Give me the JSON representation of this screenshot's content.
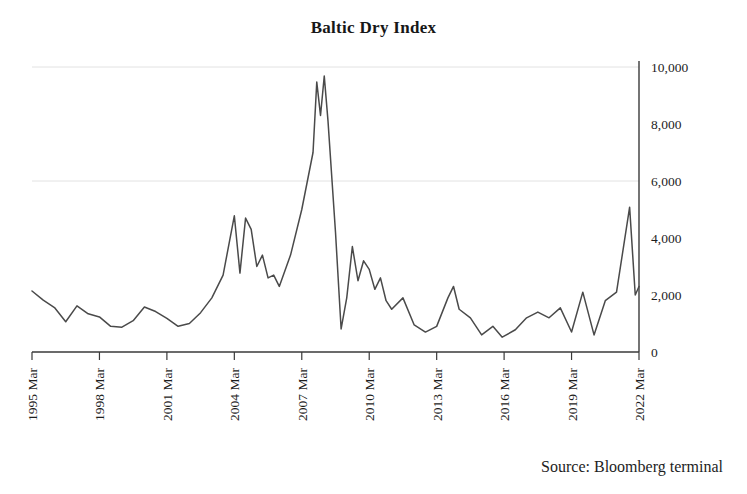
{
  "figure": {
    "title": "Baltic Dry Index",
    "source_note": "Source: Bloomberg terminal"
  },
  "chart_data": {
    "type": "line",
    "title": "Baltic Dry Index",
    "xlabel": "",
    "ylabel": "",
    "ylim": [
      0,
      10000
    ],
    "yticks": [
      0,
      2000,
      4000,
      6000,
      8000,
      10000
    ],
    "ytick_labels": [
      "0",
      "2,000",
      "4,000",
      "6,000",
      "8,000",
      "10,000"
    ],
    "y_axis_position": "right",
    "xtick_labels": [
      "1995 Mar",
      "1998 Mar",
      "2001 Mar",
      "2004 Mar",
      "2007 Mar",
      "2010 Mar",
      "2013 Mar",
      "2016 Mar",
      "2019 Mar",
      "2022 Mar"
    ],
    "xtick_rotation": 90,
    "grid": "horizontal-faint",
    "legend": "none",
    "line_color": "#4a4a4a",
    "series": [
      {
        "name": "Baltic Dry Index",
        "x": [
          "1995 Mar",
          "1995 Sep",
          "1996 Mar",
          "1996 Sep",
          "1997 Mar",
          "1997 Sep",
          "1998 Mar",
          "1998 Sep",
          "1999 Mar",
          "1999 Sep",
          "2000 Mar",
          "2000 Sep",
          "2001 Mar",
          "2001 Sep",
          "2002 Mar",
          "2002 Sep",
          "2003 Mar",
          "2003 Sep",
          "2004 Mar",
          "2004 Jun",
          "2004 Sep",
          "2004 Dec",
          "2005 Mar",
          "2005 Jun",
          "2005 Sep",
          "2005 Dec",
          "2006 Mar",
          "2006 Sep",
          "2007 Mar",
          "2007 Sep",
          "2007 Nov",
          "2008 Jan",
          "2008 Mar",
          "2008 May",
          "2008 Sep",
          "2008 Dec",
          "2009 Mar",
          "2009 Jun",
          "2009 Sep",
          "2009 Dec",
          "2010 Mar",
          "2010 Jun",
          "2010 Sep",
          "2010 Dec",
          "2011 Mar",
          "2011 Sep",
          "2012 Mar",
          "2012 Sep",
          "2013 Mar",
          "2013 Sep",
          "2013 Dec",
          "2014 Mar",
          "2014 Sep",
          "2015 Mar",
          "2015 Sep",
          "2016 Feb",
          "2016 Sep",
          "2017 Mar",
          "2017 Sep",
          "2018 Mar",
          "2018 Sep",
          "2019 Mar",
          "2019 Sep",
          "2020 Mar",
          "2020 Sep",
          "2021 Mar",
          "2021 Oct",
          "2022 Jan",
          "2022 Mar"
        ],
        "values": [
          2140,
          1820,
          1560,
          1060,
          1620,
          1340,
          1230,
          900,
          870,
          1100,
          1580,
          1420,
          1180,
          900,
          1000,
          1380,
          1900,
          2700,
          4780,
          2770,
          4700,
          4300,
          3000,
          3400,
          2600,
          2700,
          2300,
          3400,
          5000,
          7000,
          9470,
          8300,
          9680,
          8100,
          4200,
          810,
          1900,
          3700,
          2500,
          3200,
          2900,
          2200,
          2600,
          1800,
          1500,
          1900,
          950,
          700,
          900,
          1900,
          2300,
          1500,
          1200,
          600,
          900,
          520,
          780,
          1200,
          1400,
          1200,
          1550,
          700,
          2100,
          600,
          1800,
          2100,
          5080,
          2000,
          2300
        ]
      }
    ],
    "annotations": [
      {
        "text": "2008 peak ~9,680",
        "visible": false
      }
    ]
  },
  "axes": {
    "x_axis_name": "time-axis",
    "y_axis_name": "index-value-axis"
  }
}
